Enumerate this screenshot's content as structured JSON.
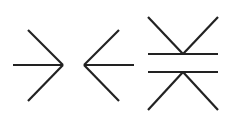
{
  "diagram": {
    "title": "",
    "stroke_color": "#222222",
    "background": "#ffffff",
    "stroke_width": 2.2,
    "figures": [
      {
        "name": "arrow-pointing-right",
        "lines": [
          [
            13,
            65,
            63,
            65
          ],
          [
            28,
            30,
            63,
            65
          ],
          [
            63,
            65,
            28,
            101
          ]
        ]
      },
      {
        "name": "arrow-pointing-left",
        "lines": [
          [
            84,
            65,
            134,
            65
          ],
          [
            119,
            30,
            84,
            65
          ],
          [
            84,
            65,
            119,
            101
          ]
        ]
      },
      {
        "name": "converging-wedges-with-parallel-lines",
        "lines": [
          [
            148,
            17,
            183,
            54
          ],
          [
            218,
            17,
            183,
            54
          ],
          [
            148,
            54,
            218,
            54
          ],
          [
            148,
            72,
            218,
            72
          ],
          [
            183,
            72,
            148,
            110
          ],
          [
            183,
            72,
            218,
            110
          ]
        ]
      }
    ]
  }
}
